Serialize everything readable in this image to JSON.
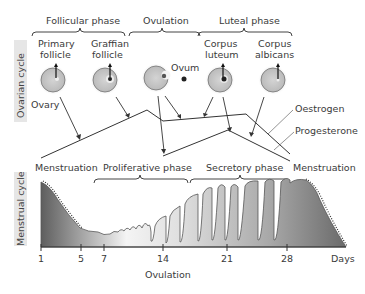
{
  "side_labels": {
    "ovarian": "Ovarian cycle",
    "menstrual": "Menstrual cycle"
  },
  "ovarian_phases": {
    "follicular": "Follicular phase",
    "ovulation": "Ovulation",
    "luteal": "Luteal phase"
  },
  "follicles": {
    "primary": [
      "Primary",
      "follicle"
    ],
    "graafian": [
      "Graffian",
      "follicle"
    ],
    "corpus_luteum": [
      "Corpus",
      "luteum"
    ],
    "corpus_albicans": [
      "Corpus",
      "albicans"
    ],
    "ovum": "Ovum",
    "ovary": "Ovary"
  },
  "hormones": {
    "oestrogen": "Oestrogen",
    "progesterone": "Progesterone"
  },
  "uterine_phases": {
    "menstruation_start": "Menstruation",
    "proliferative": "Proliferative phase",
    "secretory": "Secretory phase",
    "menstruation_end": "Menstruation"
  },
  "axis": {
    "ticks": [
      "1",
      "5",
      "7",
      "14",
      "21",
      "28"
    ],
    "unit": "Days",
    "ovulation_label": "Ovulation"
  },
  "colors": {
    "side_strip": "#e6e6e6",
    "follicle_fill": "#c8c8c8",
    "endometrium_dark": "#6e6e6e",
    "endometrium_light": "#f2f2f2",
    "line": "#333333"
  }
}
